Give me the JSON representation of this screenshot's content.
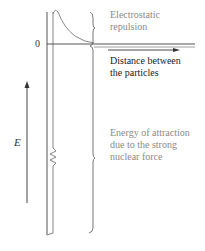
{
  "diagram": {
    "labels": {
      "repulsion_line1": "Electrostatic",
      "repulsion_line2": "repulsion",
      "distance_line1": "Distance between",
      "distance_line2": "the particles",
      "attraction_line1": "Energy of attraction",
      "attraction_line2": "due to the strong",
      "attraction_line3": "nuclear force",
      "zero": "0",
      "energy_axis": "E"
    },
    "colors": {
      "line": "#555555",
      "label_gray": "#8a8a8a",
      "label_dark": "#1a1a1a"
    }
  }
}
